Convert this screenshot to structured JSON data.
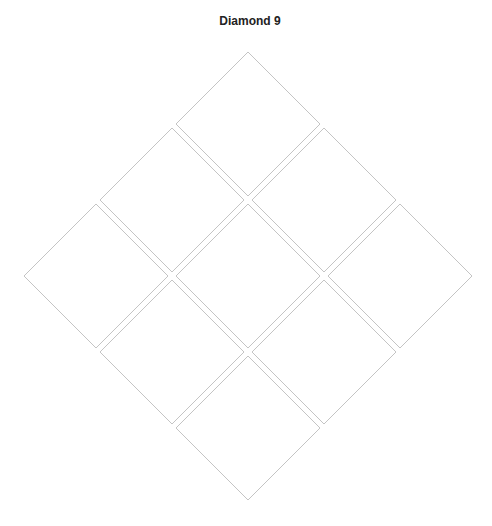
{
  "title": "Diamond 9",
  "style": {
    "stroke": "#c4c4c4",
    "fill": "#ffffff",
    "background": "#ffffff"
  },
  "tiles": [
    {
      "id": "tile-1",
      "row": 1,
      "position": "top",
      "label": ""
    },
    {
      "id": "tile-2",
      "row": 2,
      "position": "upper-left",
      "label": ""
    },
    {
      "id": "tile-3",
      "row": 2,
      "position": "upper-right",
      "label": ""
    },
    {
      "id": "tile-4",
      "row": 3,
      "position": "left",
      "label": ""
    },
    {
      "id": "tile-5",
      "row": 3,
      "position": "center",
      "label": ""
    },
    {
      "id": "tile-6",
      "row": 3,
      "position": "right",
      "label": ""
    },
    {
      "id": "tile-7",
      "row": 4,
      "position": "lower-left",
      "label": ""
    },
    {
      "id": "tile-8",
      "row": 4,
      "position": "lower-right",
      "label": ""
    },
    {
      "id": "tile-9",
      "row": 5,
      "position": "bottom",
      "label": ""
    }
  ]
}
